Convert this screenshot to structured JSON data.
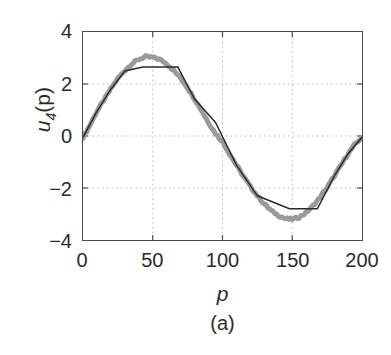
{
  "chart_data": {
    "type": "line",
    "title": "",
    "caption": "(a)",
    "xlabel": "p",
    "ylabel": "u_4(p)",
    "ylabel_base": "u",
    "ylabel_sub": "4",
    "ylabel_arg": "(p)",
    "xlim": [
      0,
      200
    ],
    "ylim": [
      -4,
      4
    ],
    "xticks": [
      0,
      50,
      100,
      150,
      200
    ],
    "yticks": [
      -4,
      -2,
      0,
      2,
      4
    ],
    "xticklabels": [
      "0",
      "50",
      "100",
      "150",
      "200"
    ],
    "yticklabels": [
      "-4",
      "-2",
      "0",
      "2",
      "4"
    ],
    "grid": true,
    "grid_style": "dotted",
    "grid_x": [
      50,
      100,
      150
    ],
    "grid_y": [
      -2,
      0,
      2
    ],
    "legend": "none",
    "series": [
      {
        "name": "noisy-sine",
        "color": "#9a9a9a",
        "width": 5,
        "style": "solid",
        "description": "thick grey noisy sinusoid, amplitude about 3.1, one full period over p = 0 to 200",
        "x": [
          0,
          5,
          10,
          15,
          20,
          25,
          30,
          35,
          40,
          45,
          50,
          55,
          60,
          65,
          70,
          75,
          80,
          85,
          90,
          95,
          100,
          105,
          110,
          115,
          120,
          125,
          130,
          135,
          140,
          145,
          150,
          155,
          160,
          165,
          170,
          175,
          180,
          185,
          190,
          195,
          200
        ],
        "y": [
          -0.05,
          0.42,
          0.95,
          1.38,
          1.82,
          2.22,
          2.52,
          2.78,
          2.95,
          3.05,
          3.02,
          2.95,
          2.78,
          2.52,
          2.22,
          1.85,
          1.42,
          0.98,
          0.52,
          0.1,
          -0.22,
          -0.68,
          -1.12,
          -1.55,
          -1.95,
          -2.3,
          -2.62,
          -2.88,
          -3.05,
          -3.18,
          -3.2,
          -3.12,
          -2.95,
          -2.68,
          -2.35,
          -1.98,
          -1.55,
          -1.12,
          -0.68,
          -0.32,
          -0.05
        ]
      },
      {
        "name": "clipped-sine",
        "color": "#2b2b2b",
        "width": 1.5,
        "style": "solid",
        "description": "thin black clipped (saturated) sinusoid: linear ramps with flat plateaus at +2.65 and -2.80",
        "x": [
          0,
          10,
          20,
          30,
          43,
          68,
          80,
          95,
          110,
          125,
          148,
          168,
          180,
          190,
          200
        ],
        "y": [
          -0.05,
          0.95,
          1.8,
          2.5,
          2.65,
          2.65,
          1.42,
          0.52,
          -1.12,
          -2.3,
          -2.8,
          -2.8,
          -1.55,
          -0.68,
          -0.05
        ]
      }
    ]
  },
  "axes": {
    "y_ticks": [
      {
        "value": 4,
        "label": "4"
      },
      {
        "value": 2,
        "label": "2"
      },
      {
        "value": 0,
        "label": "0"
      },
      {
        "value": -2,
        "label": "−2"
      },
      {
        "value": -4,
        "label": "−4"
      }
    ],
    "x_ticks": [
      {
        "value": 0,
        "label": "0"
      },
      {
        "value": 50,
        "label": "50"
      },
      {
        "value": 100,
        "label": "100"
      },
      {
        "value": 150,
        "label": "150"
      },
      {
        "value": 200,
        "label": "200"
      }
    ]
  },
  "colors": {
    "frame": "#4a4a4a",
    "grid": "#b9b9b9",
    "grey_series": "#9a9a9a",
    "black_series": "#2b2b2b",
    "background": "#ffffff",
    "text": "#2b2b2b"
  }
}
